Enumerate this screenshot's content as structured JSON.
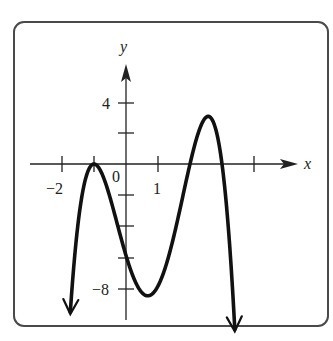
{
  "chart_data": {
    "type": "line",
    "title": "",
    "xlabel": "x",
    "ylabel": "y",
    "function": "f(x) = -(x+1)^2 (x-2)(x-3)",
    "x_ticks": [
      -2,
      -1,
      1,
      4
    ],
    "x_tick_labels": [
      "-2",
      "0",
      "1"
    ],
    "y_ticks": [
      4,
      2,
      -2,
      -4,
      -6,
      -8
    ],
    "y_tick_labels": [
      "4",
      "-8"
    ],
    "xlim": [
      -2.2,
      5.4
    ],
    "ylim": [
      -10,
      6
    ],
    "key_points": [
      {
        "label": "local max (zero, double root)",
        "x": -1,
        "y": 0
      },
      {
        "label": "y-intercept",
        "x": 0,
        "y": -6
      },
      {
        "label": "local min",
        "x": 0.66,
        "y": -8.6
      },
      {
        "label": "zero",
        "x": 2,
        "y": 0
      },
      {
        "label": "local max",
        "x": 2.6,
        "y": 3.1
      },
      {
        "label": "zero",
        "x": 3,
        "y": 0
      }
    ],
    "end_behavior": "both ends go to negative infinity (down arrows)",
    "grid": false
  },
  "labels": {
    "x_axis": "x",
    "y_axis": "y",
    "origin": "0",
    "x_minus2": "−2",
    "x_1": "1",
    "y_4": "4",
    "y_minus8": "−8"
  },
  "colors": {
    "curve": "#111111",
    "axis": "#222222",
    "frame": "#4a4a4a"
  }
}
